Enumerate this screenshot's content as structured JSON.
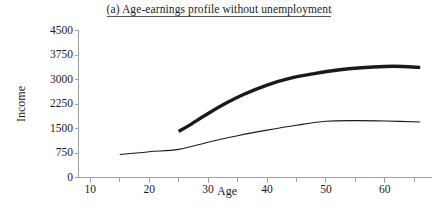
{
  "chart_data": {
    "type": "line",
    "title": "(a) Age-earnings profile without unemployment",
    "xlabel": "Age",
    "ylabel": "Income",
    "xlim": [
      8,
      68
    ],
    "ylim": [
      0,
      4500
    ],
    "xticks": [
      10,
      20,
      30,
      40,
      50,
      60
    ],
    "xtick_labels": [
      "10",
      "20",
      "30",
      "40",
      "50",
      "60"
    ],
    "yticks": [
      0,
      750,
      1500,
      2250,
      3000,
      3750,
      4500
    ],
    "ytick_labels": [
      "0",
      "750",
      "1500",
      "2250",
      "3000",
      "3750",
      "4500"
    ],
    "grid": false,
    "legend": "none",
    "series": [
      {
        "name": "high-education-profile",
        "style": "thick",
        "color": "#1a1a1a",
        "width": 3.4,
        "x": [
          25,
          27,
          30,
          33,
          36,
          40,
          44,
          48,
          52,
          56,
          60,
          63,
          66
        ],
        "y": [
          1410,
          1620,
          1960,
          2270,
          2540,
          2830,
          3040,
          3180,
          3290,
          3360,
          3400,
          3400,
          3370
        ]
      },
      {
        "name": "low-education-profile",
        "style": "thin",
        "color": "#1a1a1a",
        "width": 1.1,
        "x": [
          15,
          20,
          25,
          30,
          35,
          40,
          45,
          50,
          55,
          60,
          66
        ],
        "y": [
          700,
          790,
          860,
          1080,
          1280,
          1450,
          1600,
          1720,
          1740,
          1730,
          1700
        ]
      }
    ]
  },
  "axes": {
    "axis_color": "#a0a0a0",
    "tick_color": "#a0a0a0"
  }
}
